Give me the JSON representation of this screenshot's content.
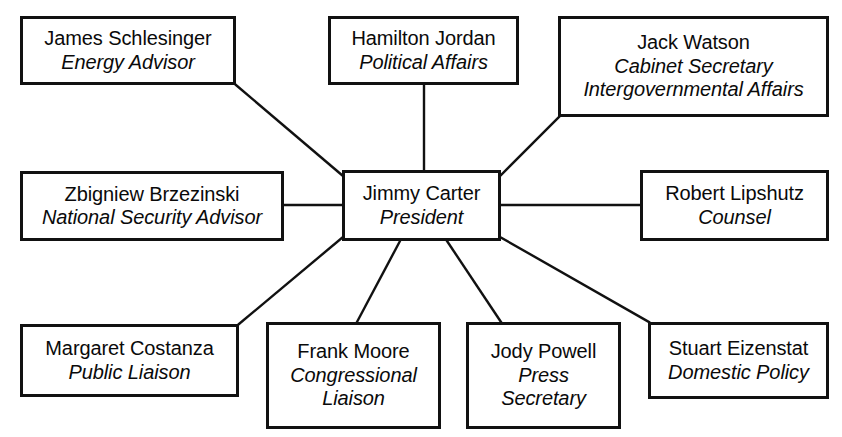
{
  "diagram": {
    "type": "organizational-chart",
    "line_color": "#111111",
    "box_border_color": "#111111",
    "background_color": "#ffffff",
    "nodes": [
      {
        "id": "schlesinger",
        "name": "James Schlesinger",
        "role_lines": [
          "Energy Advisor"
        ],
        "row": "top",
        "x": 20,
        "y": 16,
        "w": 216,
        "h": 69
      },
      {
        "id": "jordan",
        "name": "Hamilton Jordan",
        "role_lines": [
          "Political Affairs"
        ],
        "row": "top",
        "x": 328,
        "y": 16,
        "w": 191,
        "h": 69
      },
      {
        "id": "watson",
        "name": "Jack Watson",
        "role_lines": [
          "Cabinet Secretary",
          "Intergovernmental Affairs"
        ],
        "row": "top",
        "x": 558,
        "y": 16,
        "w": 271,
        "h": 101
      },
      {
        "id": "brzezinski",
        "name": "Zbigniew Brzezinski",
        "role_lines": [
          "National Security Advisor"
        ],
        "row": "middle",
        "x": 20,
        "y": 171,
        "w": 264,
        "h": 70
      },
      {
        "id": "carter",
        "name": "Jimmy Carter",
        "role_lines": [
          "President"
        ],
        "row": "center",
        "x": 342,
        "y": 170,
        "w": 159,
        "h": 71
      },
      {
        "id": "lipshutz",
        "name": "Robert Lipshutz",
        "role_lines": [
          "Counsel"
        ],
        "row": "middle",
        "x": 640,
        "y": 170,
        "w": 189,
        "h": 71
      },
      {
        "id": "costanza",
        "name": "Margaret Costanza",
        "role_lines": [
          "Public Liaison"
        ],
        "row": "bottom",
        "x": 20,
        "y": 324,
        "w": 219,
        "h": 73
      },
      {
        "id": "moore",
        "name": "Frank Moore",
        "role_lines": [
          "Congressional",
          "Liaison"
        ],
        "row": "bottom",
        "x": 266,
        "y": 322,
        "w": 175,
        "h": 107
      },
      {
        "id": "powell",
        "name": "Jody Powell",
        "role_lines": [
          "Press",
          "Secretary"
        ],
        "row": "bottom",
        "x": 466,
        "y": 322,
        "w": 155,
        "h": 107
      },
      {
        "id": "eizenstat",
        "name": "Stuart Eizenstat",
        "role_lines": [
          "Domestic Policy"
        ],
        "row": "bottom",
        "x": 648,
        "y": 322,
        "w": 181,
        "h": 77
      }
    ],
    "edges": [
      {
        "from": "carter",
        "to": "schlesinger",
        "x1": 343,
        "y1": 176,
        "x2": 236,
        "y2": 85
      },
      {
        "from": "carter",
        "to": "jordan",
        "x1": 424,
        "y1": 170,
        "x2": 424,
        "y2": 85
      },
      {
        "from": "carter",
        "to": "watson",
        "x1": 500,
        "y1": 176,
        "x2": 559,
        "y2": 117
      },
      {
        "from": "carter",
        "to": "brzezinski",
        "x1": 342,
        "y1": 205,
        "x2": 284,
        "y2": 205
      },
      {
        "from": "carter",
        "to": "lipshutz",
        "x1": 501,
        "y1": 205,
        "x2": 640,
        "y2": 205
      },
      {
        "from": "carter",
        "to": "costanza",
        "x1": 343,
        "y1": 237,
        "x2": 239,
        "y2": 324
      },
      {
        "from": "carter",
        "to": "moore",
        "x1": 400,
        "y1": 241,
        "x2": 357,
        "y2": 322
      },
      {
        "from": "carter",
        "to": "powell",
        "x1": 447,
        "y1": 241,
        "x2": 501,
        "y2": 322
      },
      {
        "from": "carter",
        "to": "eizenstat",
        "x1": 500,
        "y1": 237,
        "x2": 649,
        "y2": 322
      }
    ]
  }
}
